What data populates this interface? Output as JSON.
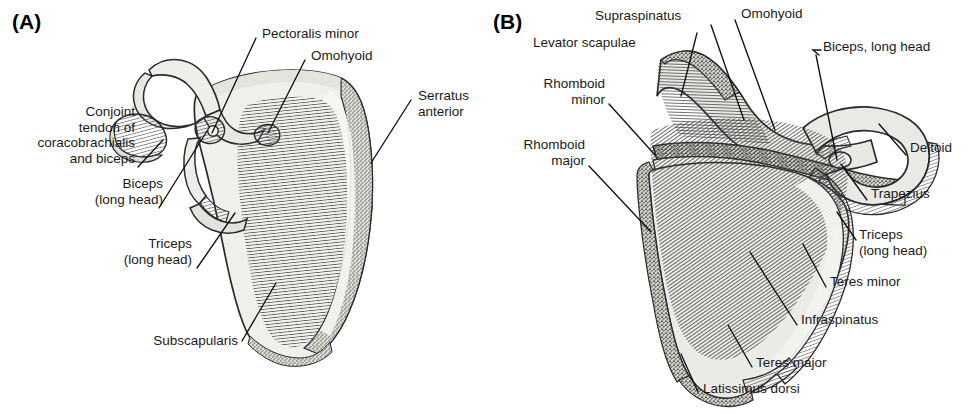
{
  "figure": {
    "width": 969,
    "height": 414,
    "background": "#ffffff",
    "ink_color": "#1a1a1a"
  },
  "panels": [
    {
      "id": "A",
      "letter": "(A)",
      "view": "costal (anterior) surface of right scapula",
      "labels": [
        {
          "key": "pectoralis_minor",
          "text": "Pectoralis minor"
        },
        {
          "key": "omohyoid",
          "text": "Omohyoid"
        },
        {
          "key": "serratus_anterior",
          "text": "Serratus\nanterior"
        },
        {
          "key": "conjoint_tendon",
          "text": "Conjoint\ntendon of\ncoracobrachialis\nand biceps"
        },
        {
          "key": "biceps_long_head",
          "text": "Biceps\n(long head)"
        },
        {
          "key": "triceps_long_head",
          "text": "Triceps\n(long head)"
        },
        {
          "key": "subscapularis",
          "text": "Subscapularis"
        }
      ]
    },
    {
      "id": "B",
      "letter": "(B)",
      "view": "dorsal (posterior) surface of right scapula",
      "labels": [
        {
          "key": "supraspinatus",
          "text": "Supraspinatus"
        },
        {
          "key": "omohyoid",
          "text": "Omohyoid"
        },
        {
          "key": "levator_scapulae",
          "text": "Levator scapulae"
        },
        {
          "key": "biceps_long_head",
          "text": "Biceps, long head"
        },
        {
          "key": "rhomboid_minor",
          "text": "Rhomboid\nminor"
        },
        {
          "key": "rhomboid_major",
          "text": "Rhomboid\nmajor"
        },
        {
          "key": "deltoid",
          "text": "Deltoid"
        },
        {
          "key": "trapezius",
          "text": "Trapezius"
        },
        {
          "key": "triceps_long_head",
          "text": "Triceps\n(long head)"
        },
        {
          "key": "teres_minor",
          "text": "Teres minor"
        },
        {
          "key": "infraspinatus",
          "text": "Infraspinatus"
        },
        {
          "key": "teres_major",
          "text": "Teres major"
        },
        {
          "key": "latissimus_dorsi",
          "text": "Latissimus dorsi"
        }
      ]
    }
  ],
  "colors": {
    "bone_fill_light": "#efefec",
    "bone_fill_mid": "#d9d9d4",
    "bone_outline": "#2b2b2b",
    "hatch_stroke": "#3a3a3a",
    "stipple": "#6e6e68",
    "leader_line": "#111111"
  }
}
